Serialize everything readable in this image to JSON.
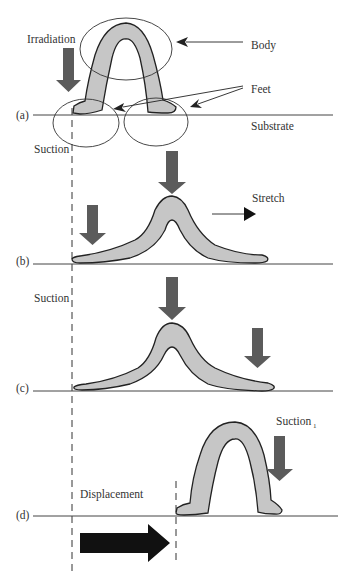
{
  "figure": {
    "panels": [
      {
        "id": "a",
        "label": "(a)"
      },
      {
        "id": "b",
        "label": "(b)"
      },
      {
        "id": "c",
        "label": "(c)"
      },
      {
        "id": "d",
        "label": "(d)"
      }
    ],
    "labels": {
      "irradiation": "Irradiation",
      "body": "Body",
      "feet": "Feet",
      "substrate": "Substrate",
      "suction_a": "Suction",
      "stretch": "Stretch",
      "suction_c": "Suction",
      "suction_d": "Suction",
      "suction_d_sub": "1",
      "displacement": "Displacement"
    },
    "colors": {
      "body_fill": "#c6c6c6",
      "gray_arrow": "#5b5b5b",
      "black_arrow": "#111111",
      "outline": "#222222"
    }
  }
}
